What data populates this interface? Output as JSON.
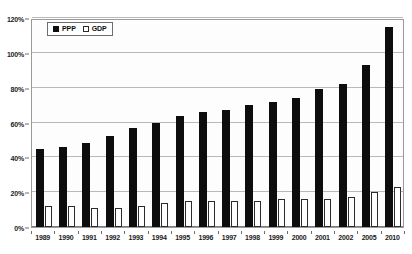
{
  "chart_data": {
    "type": "bar",
    "title": "",
    "subtitle": "",
    "xlabel": "",
    "ylabel": "",
    "categories": [
      "1989",
      "1990",
      "1991",
      "1992",
      "1993",
      "1994",
      "1995",
      "1996",
      "1997",
      "1998",
      "1999",
      "2000",
      "2001",
      "2002",
      "2005",
      "2010"
    ],
    "series": [
      {
        "name": "PPP",
        "color": "#0d0d0d",
        "values": [
          45,
          46,
          48,
          52,
          57,
          60,
          64,
          66,
          67,
          70,
          72,
          74,
          79,
          82,
          93,
          115
        ]
      },
      {
        "name": "GDP",
        "color": "#ffffff",
        "values": [
          12,
          12,
          11,
          11,
          12,
          14,
          15,
          15,
          15,
          15,
          16,
          16,
          16,
          17,
          20,
          23
        ]
      }
    ],
    "ylim": [
      0,
      120
    ],
    "y_ticks": [
      0,
      20,
      40,
      60,
      80,
      100,
      120
    ],
    "y_tick_labels": [
      "0%",
      "20%",
      "40%",
      "60%",
      "80%",
      "100%",
      "120%"
    ],
    "grid": true,
    "legend_position": "top-left"
  },
  "legend": {
    "entries": [
      {
        "label": "PPP",
        "swatch": "filled-square-icon"
      },
      {
        "label": "GDP",
        "swatch": "hollow-square-icon"
      }
    ]
  }
}
